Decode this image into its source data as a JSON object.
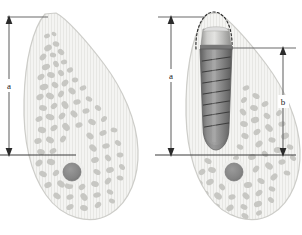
{
  "figure": {
    "panels": [
      {
        "id": "left",
        "name": "bone-only-panel",
        "description": "Cross-section of posterior mandible showing cortical outline, trabecular bone and mandibular canal",
        "dimensions": [
          {
            "label": "a",
            "name": "dimension-a",
            "description": "Vertical bone height from alveolar crest to mandibular canal",
            "top_y": 17,
            "bottom_y": 155
          }
        ],
        "features": [
          {
            "name": "alveolar-crest",
            "label": ""
          },
          {
            "name": "mandibular-canal",
            "label": ""
          },
          {
            "name": "trabecular-bone",
            "label": ""
          },
          {
            "name": "cortical-outline",
            "label": ""
          }
        ]
      },
      {
        "id": "right",
        "name": "bone-with-implant-panel",
        "description": "Same cross-section with threaded dental implant placed and planned crown outlined",
        "dimensions": [
          {
            "label": "a",
            "name": "dimension-a",
            "description": "Total vertical height from crown platform level to mandibular canal",
            "top_y": 17,
            "bottom_y": 155
          },
          {
            "label": "b",
            "name": "dimension-b",
            "description": "Implant length from implant platform to implant apex",
            "top_y": 48,
            "bottom_y": 155
          }
        ],
        "features": [
          {
            "name": "implant-abutment",
            "label": ""
          },
          {
            "name": "implant-body-threaded",
            "label": ""
          },
          {
            "name": "implant-apex",
            "label": ""
          },
          {
            "name": "planned-crown-outline",
            "label": ""
          },
          {
            "name": "mandibular-canal",
            "label": ""
          },
          {
            "name": "trabecular-bone",
            "label": ""
          },
          {
            "name": "cortical-outline",
            "label": ""
          }
        ]
      }
    ],
    "colors": {
      "background": "#ffffff",
      "bone_fill": "#f2f2f0",
      "bone_outline": "#cfcfcb",
      "trabecular": "#c9c9c5",
      "canal": "#8a8a8a",
      "implant_body": "#8e8e8e",
      "implant_dark": "#6f6f6f",
      "abutment": "#c8c8c6",
      "dimension_line": "#6a6a6a",
      "label_text": "#1a1a1a"
    }
  }
}
